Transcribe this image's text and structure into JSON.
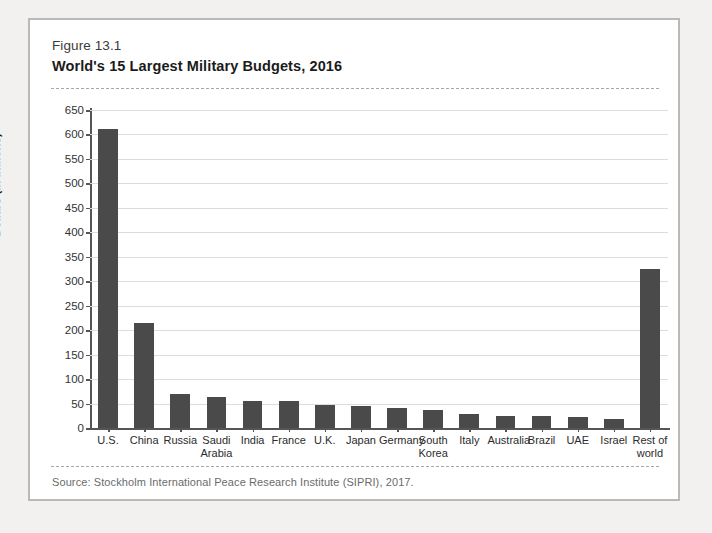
{
  "figure": {
    "number": "Figure 13.1",
    "title": "World's 15 Largest Military Budgets, 2016",
    "source": "Source:  Stockholm International Peace Research Institute (SIPRI), 2017."
  },
  "colors": {
    "bar": "#4a4a4a",
    "grid": "#dcdcdc",
    "axis": "#555555",
    "page_background": "#f2f1ef",
    "figure_background": "#ffffff",
    "figure_border": "#b9b9b9"
  },
  "chart_data": {
    "type": "bar",
    "title": "World's 15 Largest Military Budgets, 2016",
    "xlabel": "",
    "ylabel": "Dollars (in billions)",
    "ylim": [
      0,
      650
    ],
    "ytick_step": 50,
    "yticks": [
      0,
      50,
      100,
      150,
      200,
      250,
      300,
      350,
      400,
      450,
      500,
      550,
      600,
      650
    ],
    "grid": true,
    "legend": "none",
    "categories": [
      "U.S.",
      "China",
      "Russia",
      "Saudi Arabia",
      "India",
      "France",
      "U.K.",
      "Japan",
      "Germany",
      "South Korea",
      "Italy",
      "Australia",
      "Brazil",
      "UAE",
      "Israel",
      "Rest of world"
    ],
    "values": [
      611,
      215,
      69,
      64,
      56,
      56,
      48,
      46,
      41,
      37,
      28,
      25,
      24,
      22,
      18,
      325
    ]
  }
}
